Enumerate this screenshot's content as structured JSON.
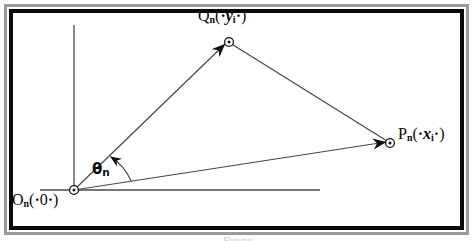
{
  "figure": {
    "kind": "vector-diagram",
    "background_color": "#ffffff",
    "line_color": "#3a3a3a",
    "text_color": "#0a0a0a",
    "frame": {
      "outer_border_color": "#9a9a9a",
      "inner_border_color": "#000000",
      "outer_border_width": 3,
      "inner_border_width": 4
    },
    "axes": {
      "vertical": {
        "x": 74,
        "y_top": 25,
        "y_bottom": 192
      },
      "horizontal": {
        "y": 190,
        "x_left": 40,
        "x_right": 320
      }
    },
    "points": [
      {
        "id": "O",
        "name": "origin-point",
        "x": 74,
        "y": 190,
        "label": "O_n(.0.)"
      },
      {
        "id": "Q",
        "name": "q-point",
        "x": 228,
        "y": 41,
        "label": "Q_n(.y_i.)"
      },
      {
        "id": "P",
        "name": "p-point",
        "x": 390,
        "y": 143,
        "label": "P_n(.x_i.)"
      }
    ],
    "vectors": [
      {
        "id": "OQ",
        "name": "vector-o-to-q",
        "from": "O",
        "to": "Q",
        "arrow": true
      },
      {
        "id": "OP",
        "name": "vector-o-to-p",
        "from": "O",
        "to": "P",
        "arrow": true
      },
      {
        "id": "QP",
        "name": "segment-q-to-p",
        "from": "Q",
        "to": "P",
        "arrow": false
      }
    ],
    "angle": {
      "name": "theta-angle",
      "vertex": "O",
      "arc_radius": 58,
      "arrow": true,
      "label_x": 92,
      "label_y": 162
    }
  },
  "labels": {
    "q_point": {
      "base": "Q",
      "sub": "n",
      "open": "(",
      "mid_dot_left": "·",
      "var": "y",
      "var_sub": "i",
      "mid_dot_right": "·",
      "close": ")"
    },
    "p_point": {
      "base": "P",
      "sub": "n",
      "open": "(",
      "mid_dot_left": "·",
      "var": "x",
      "var_sub": "i",
      "mid_dot_right": "·",
      "close": ")"
    },
    "o_point": {
      "base": "O",
      "sub": "n",
      "open": "(",
      "mid_dot_left": "·",
      "var": "0",
      "mid_dot_right": "·",
      "close": ")"
    },
    "theta": {
      "base": "θ",
      "sub": "n"
    }
  },
  "caption": {
    "text": "Figure"
  }
}
